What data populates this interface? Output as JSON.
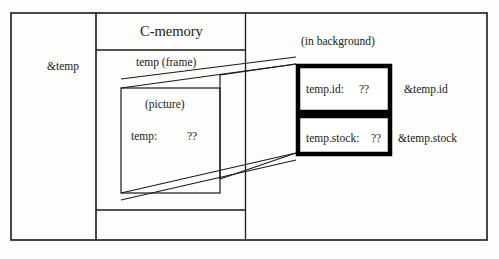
{
  "diagram": {
    "title": "C-memory",
    "outer_frame": {
      "name": "figure-border"
    },
    "labels": {
      "pointer_temp": "&temp",
      "c_memory": "C-memory",
      "temp_frame": "temp (frame)",
      "picture": "(picture)",
      "temp_value_name": "temp:",
      "temp_value": "??",
      "in_background": "(in background)",
      "temp_id_name": "temp.id:",
      "temp_id_value": "??",
      "temp_id_pointer": "&temp.id",
      "temp_stock_name": "temp.stock:",
      "temp_stock_value": "??",
      "temp_stock_pointer": "&temp.stock"
    },
    "colors": {
      "line": "#1a1a1a",
      "bold_box": "#000000",
      "background": "#fdfdfc",
      "text": "#1a1a1a"
    }
  }
}
